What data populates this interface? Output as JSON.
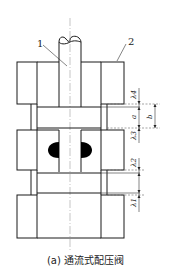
{
  "figure": {
    "caption": "(a) 通流式配压阀",
    "part_labels": [
      {
        "id": "1",
        "label": "1"
      },
      {
        "id": "2",
        "label": "2"
      }
    ],
    "dimension_labels": {
      "lambda4": "λ4",
      "a": "a",
      "b": "b",
      "lambda3": "λ3",
      "lambda2": "λ2",
      "lambda1": "λ1"
    },
    "colors": {
      "line": "#1a1a1a",
      "hatch": "#555555",
      "fill_black": "#000000",
      "background": "#ffffff"
    }
  }
}
